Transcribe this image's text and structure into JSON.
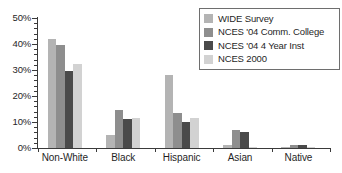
{
  "chart_data": {
    "type": "bar",
    "title": "",
    "xlabel": "",
    "ylabel": "",
    "ylim": [
      0,
      50
    ],
    "ytick_labels": [
      "0%",
      "10%",
      "20%",
      "30%",
      "40%",
      "50%"
    ],
    "ytick_values": [
      0,
      10,
      20,
      30,
      40,
      50
    ],
    "yminor_step": 2,
    "grid": false,
    "legend_position": "top-right",
    "categories": [
      "Non-White",
      "Black",
      "Hispanic",
      "Asian",
      "Native"
    ],
    "series": [
      {
        "name": "WIDE Survey",
        "color": "#b4b4b4",
        "values": [
          42,
          5,
          28,
          1,
          0.5
        ]
      },
      {
        "name": "NCES '04 Comm. College",
        "color": "#8e8e8e",
        "values": [
          39.5,
          14.5,
          13.5,
          7,
          1
        ]
      },
      {
        "name": "NCES '04 4 Year Inst",
        "color": "#4a4a4a",
        "values": [
          29.5,
          11,
          10,
          6,
          1
        ]
      },
      {
        "name": "NCES 2000",
        "color": "#d2d2d2",
        "values": [
          32.5,
          11.5,
          11.5,
          0.5,
          0.5
        ]
      }
    ]
  },
  "legend": {
    "items": [
      {
        "label": "WIDE Survey"
      },
      {
        "label": "NCES '04 Comm. College"
      },
      {
        "label": "NCES '04 4 Year Inst"
      },
      {
        "label": "NCES 2000"
      }
    ]
  },
  "colors": {
    "axis": "#3a3a3a",
    "text": "#1f1f1f",
    "background": "#ffffff",
    "legend_border": "#6e6e6e"
  }
}
